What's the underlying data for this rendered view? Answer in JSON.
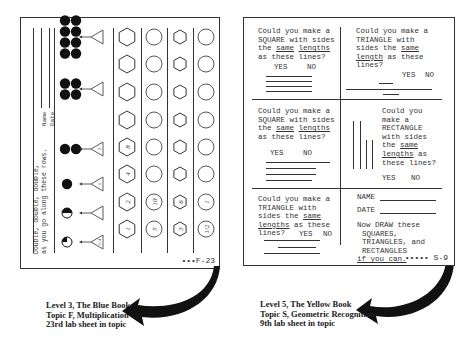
{
  "left_sheet": {
    "instruction_line1": "Double, double, double,",
    "instruction_line2": "as you go along these rows.",
    "name_label": "Name",
    "date_label": "Date",
    "dot_rows": [
      {
        "dots": 8,
        "triangle_label": ""
      },
      {
        "dots": 4,
        "triangle_label": ""
      },
      {
        "dots": 2,
        "triangle_label": "2"
      },
      {
        "dots": 1,
        "triangle_label": "1"
      },
      {
        "dots": 0.5,
        "triangle_label": ""
      },
      {
        "dots": 0.25,
        "triangle_label": "1/4"
      }
    ],
    "shape_columns": [
      {
        "shape": "hexagon",
        "values": [
          "",
          "",
          "",
          "",
          "8",
          "4",
          "2",
          "1"
        ]
      },
      {
        "shape": "circle",
        "values": [
          "",
          "",
          "",
          "",
          "",
          "",
          "10",
          "5"
        ]
      },
      {
        "shape": "hexagon",
        "values": [
          "",
          "",
          "",
          "",
          "",
          "",
          "6",
          "3"
        ]
      },
      {
        "shape": "circle",
        "values": [
          "",
          "",
          "",
          "",
          "",
          "",
          "1",
          "1/2"
        ]
      }
    ],
    "page_code": "•••F-23"
  },
  "left_caption": {
    "line1": "Level 3, The Blue Book",
    "line2": "Topic F, Multiplication",
    "line3": "23rd lab sheet in topic"
  },
  "right_sheet": {
    "q1": {
      "l1": "Could you make a",
      "l2": "SQUARE with sides",
      "l3a": "the ",
      "l3b": "same",
      "l3c": " ",
      "l3d": "lengths",
      "l4": "as these lines?",
      "yes": "YES",
      "no": "NO"
    },
    "q2": {
      "l1": "Could you make a",
      "l2": "TRIANGLE with",
      "l3a": "sides the ",
      "l3b": "same",
      "l4a": "length",
      "l4b": " as these",
      "l5": "lines?",
      "yes": "YES",
      "no": "NO"
    },
    "q3": {
      "l1": "Could you make a",
      "l2": "SQUARE with sides",
      "l3a": "the ",
      "l3b": "same",
      "l3c": " ",
      "l3d": "lengths",
      "l4": "as these lines?",
      "yes": "YES",
      "no": "NO"
    },
    "q4": {
      "l1": "Could you",
      "l2": "make a",
      "l3": "RECTANGLE",
      "l4": "with sides",
      "l5a": "the ",
      "l5b": "same",
      "l6a": "lengths",
      "l6b": " as",
      "l7": "these lines?",
      "yes": "YES",
      "no": "NO"
    },
    "q5": {
      "l1": "Could you make a",
      "l2": "TRIANGLE with",
      "l3a": "sides the ",
      "l3b": "same",
      "l4a": "lengths",
      "l4b": " as these",
      "l5": "lines?",
      "yes": "YES",
      "no": "NO"
    },
    "name_label": "NAME",
    "date_label": "DATE",
    "draw_l1": "Now DRAW these",
    "draw_l2": "SQUARES,",
    "draw_l3": "TRIANGLES, and",
    "draw_l4": "RECTANGLES",
    "draw_l5": "if you can.",
    "page_code": "••••• S-9"
  },
  "right_caption": {
    "line1": "Level 5, The Yellow Book",
    "line2": "Topic S, Geometric Recognition",
    "line3": "9th lab sheet in topic"
  },
  "colors": {
    "ink": "#222222",
    "paper": "#ffffff"
  }
}
